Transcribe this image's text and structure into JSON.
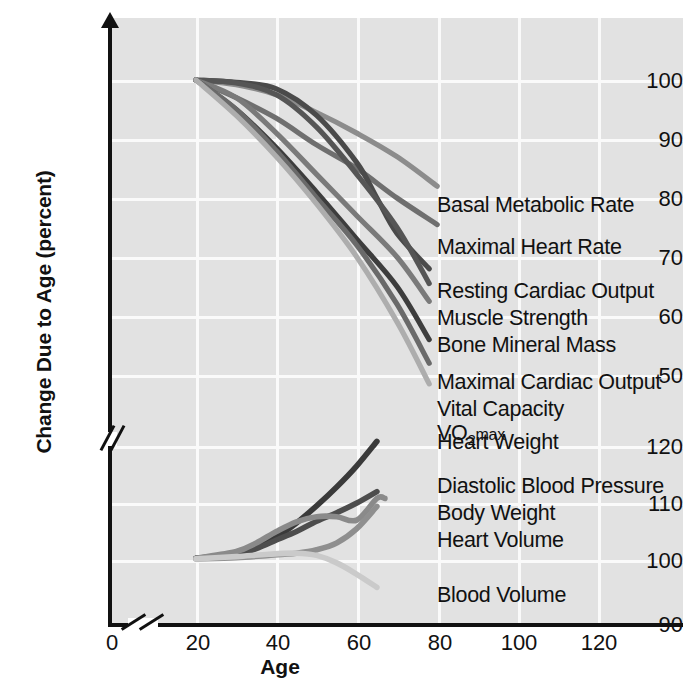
{
  "chart_data": {
    "type": "line",
    "title": "",
    "xlabel": "Age",
    "ylabel": "Change Due to Age (percent)",
    "xlim": [
      20,
      130
    ],
    "xticks": [
      0,
      20,
      40,
      60,
      80,
      100,
      120
    ],
    "axis_break": {
      "x": true,
      "y": true
    },
    "upper_panel": {
      "ylim": [
        48,
        104
      ],
      "yticks": [
        50,
        60,
        70,
        80,
        90,
        100
      ]
    },
    "lower_panel": {
      "ylim": [
        90,
        124
      ],
      "yticks": [
        90,
        100,
        110,
        120
      ]
    },
    "grid": true,
    "legend": "right-of-curve-ends",
    "series": [
      {
        "name": "Basal Metabolic Rate",
        "panel": "upper",
        "color": "#8c8c8c",
        "points": [
          [
            20,
            100
          ],
          [
            30,
            99.2
          ],
          [
            40,
            97.5
          ],
          [
            50,
            94.5
          ],
          [
            60,
            91
          ],
          [
            70,
            87
          ],
          [
            80,
            82
          ]
        ]
      },
      {
        "name": "Maximal Heart Rate",
        "panel": "upper",
        "color": "#6f6f6f",
        "points": [
          [
            20,
            100
          ],
          [
            30,
            97
          ],
          [
            40,
            93.5
          ],
          [
            50,
            89
          ],
          [
            60,
            85
          ],
          [
            70,
            80
          ],
          [
            80,
            75.5
          ]
        ]
      },
      {
        "name": "Resting Cardiac Output",
        "panel": "upper",
        "color": "#4a4a4a",
        "points": [
          [
            20,
            100
          ],
          [
            30,
            99.6
          ],
          [
            40,
            98.5
          ],
          [
            50,
            94
          ],
          [
            60,
            86
          ],
          [
            65,
            80
          ],
          [
            70,
            74
          ],
          [
            78,
            68
          ]
        ]
      },
      {
        "name": "Muscle Strength",
        "panel": "upper",
        "color": "#555555",
        "points": [
          [
            20,
            100
          ],
          [
            30,
            99.5
          ],
          [
            40,
            97.5
          ],
          [
            50,
            92
          ],
          [
            60,
            84
          ],
          [
            70,
            75
          ],
          [
            78,
            65.5
          ]
        ]
      },
      {
        "name": "Bone Mineral Mass",
        "panel": "upper",
        "color": "#7a7a7a",
        "points": [
          [
            20,
            100
          ],
          [
            30,
            97
          ],
          [
            40,
            91
          ],
          [
            50,
            84
          ],
          [
            60,
            77
          ],
          [
            70,
            70
          ],
          [
            78,
            62.5
          ]
        ]
      },
      {
        "name": "Maximal Cardiac Output",
        "panel": "upper",
        "color": "#3d3d3d",
        "points": [
          [
            20,
            100
          ],
          [
            30,
            95
          ],
          [
            40,
            88.5
          ],
          [
            50,
            81
          ],
          [
            60,
            73
          ],
          [
            70,
            65
          ],
          [
            78,
            56
          ]
        ]
      },
      {
        "name": "Vital Capacity",
        "panel": "upper",
        "color": "#6a6a6a",
        "points": [
          [
            20,
            100
          ],
          [
            30,
            95
          ],
          [
            40,
            88
          ],
          [
            50,
            80
          ],
          [
            60,
            72
          ],
          [
            70,
            62
          ],
          [
            78,
            52
          ]
        ]
      },
      {
        "name": "VO2max",
        "panel": "upper",
        "color": "#adadad",
        "points": [
          [
            20,
            100
          ],
          [
            30,
            94
          ],
          [
            40,
            87
          ],
          [
            50,
            79
          ],
          [
            60,
            70
          ],
          [
            70,
            59
          ],
          [
            78,
            48.5
          ]
        ]
      },
      {
        "name": "Heart Weight",
        "panel": "lower",
        "color": "#3a3a3a",
        "points": [
          [
            20,
            100.3
          ],
          [
            30,
            101
          ],
          [
            35,
            102.2
          ],
          [
            40,
            104
          ],
          [
            45,
            106.5
          ],
          [
            50,
            109.5
          ],
          [
            55,
            112.8
          ],
          [
            60,
            116.5
          ],
          [
            65,
            120.8
          ]
        ]
      },
      {
        "name": "Diastolic Blood Pressure",
        "panel": "lower",
        "color": "#4d4d4d",
        "points": [
          [
            20,
            100.3
          ],
          [
            30,
            101
          ],
          [
            35,
            102
          ],
          [
            40,
            103.5
          ],
          [
            45,
            105
          ],
          [
            50,
            106.8
          ],
          [
            55,
            108.3
          ],
          [
            60,
            110
          ],
          [
            65,
            112
          ]
        ]
      },
      {
        "name": "Body Weight",
        "panel": "lower",
        "color": "#8a8a8a",
        "points": [
          [
            20,
            100.3
          ],
          [
            30,
            101.5
          ],
          [
            35,
            103
          ],
          [
            40,
            105
          ],
          [
            45,
            106.7
          ],
          [
            50,
            107.6
          ],
          [
            55,
            107.6
          ],
          [
            60,
            107
          ],
          [
            65,
            110.8
          ],
          [
            67,
            110.8
          ]
        ]
      },
      {
        "name": "Heart Volume",
        "panel": "lower",
        "color": "#8f8f8f",
        "points": [
          [
            20,
            100.2
          ],
          [
            30,
            100.4
          ],
          [
            38,
            100.8
          ],
          [
            45,
            101.2
          ],
          [
            50,
            101.8
          ],
          [
            55,
            103
          ],
          [
            60,
            105.5
          ],
          [
            65,
            109.4
          ]
        ]
      },
      {
        "name": "Blood Volume",
        "panel": "lower",
        "color": "#cacaca",
        "points": [
          [
            20,
            100.2
          ],
          [
            30,
            100.6
          ],
          [
            38,
            101
          ],
          [
            45,
            101.2
          ],
          [
            50,
            100.8
          ],
          [
            55,
            99.5
          ],
          [
            60,
            97.5
          ],
          [
            65,
            95.2
          ]
        ]
      }
    ]
  },
  "axes": {
    "y_label": "Change Due to Age (percent)",
    "x_label": "Age",
    "y_ticks_upper": [
      "100",
      "90",
      "80",
      "70",
      "60",
      "50"
    ],
    "y_ticks_lower": [
      "120",
      "110",
      "100",
      "90"
    ],
    "x_ticks": [
      "0",
      "20",
      "40",
      "60",
      "80",
      "100",
      "120"
    ]
  },
  "labels": {
    "upper": [
      "Basal Metabolic Rate",
      "Maximal Heart Rate",
      "Resting Cardiac Output",
      "Muscle Strength",
      "Bone Mineral Mass",
      "Maximal Cardiac Output",
      "Vital Capacity"
    ],
    "vo2_prefix": "V",
    "vo2_o": "O",
    "vo2_sub": "2",
    "vo2_suffix": "max",
    "lower": [
      "Heart Weight",
      "Diastolic Blood Pressure",
      "Body Weight",
      "Heart Volume",
      "Blood Volume"
    ]
  }
}
